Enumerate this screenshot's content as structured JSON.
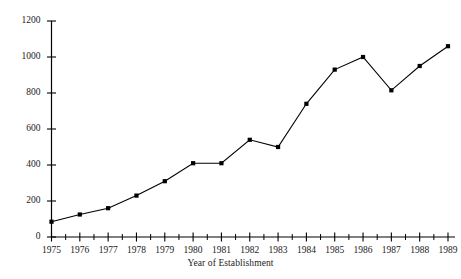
{
  "chart_data": {
    "type": "line",
    "title": "",
    "xlabel": "Year of Establishment",
    "ylabel": "",
    "x": [
      1975,
      1976,
      1977,
      1978,
      1979,
      1980,
      1981,
      1982,
      1983,
      1984,
      1985,
      1986,
      1987,
      1988,
      1989
    ],
    "categories": [
      "1975",
      "1976",
      "1977",
      "1978",
      "1979",
      "1980",
      "1981",
      "1982",
      "1983",
      "1984",
      "1985",
      "1986",
      "1987",
      "1988",
      "1989"
    ],
    "values": [
      85,
      125,
      160,
      230,
      310,
      410,
      410,
      540,
      500,
      740,
      930,
      1000,
      815,
      950,
      1060
    ],
    "series": [
      {
        "name": "Establishments",
        "values": [
          85,
          125,
          160,
          230,
          310,
          410,
          410,
          540,
          500,
          740,
          930,
          1000,
          815,
          950,
          1060
        ]
      }
    ],
    "xlim": [
      1975,
      1989
    ],
    "ylim": [
      0,
      1200
    ],
    "ytick_labels": [
      "0",
      "200",
      "400",
      "600",
      "800",
      "1000",
      "1200"
    ],
    "ytick_values": [
      0,
      200,
      400,
      600,
      800,
      1000,
      1200
    ],
    "xtick_labels": [
      "1975",
      "1976",
      "1977",
      "1978",
      "1979",
      "1980",
      "1981",
      "1982",
      "1983",
      "1984",
      "1985",
      "1986",
      "1987",
      "1988",
      "1989"
    ],
    "grid": false,
    "legend": false,
    "legend_position": "none",
    "marker": "filled-square",
    "line_color": "#000000",
    "marker_color": "#000000",
    "axis_color": "#000000",
    "background_color": "#ffffff",
    "minor_ticks_x": true
  },
  "axes": {
    "x_title": "Year of Establishment"
  }
}
